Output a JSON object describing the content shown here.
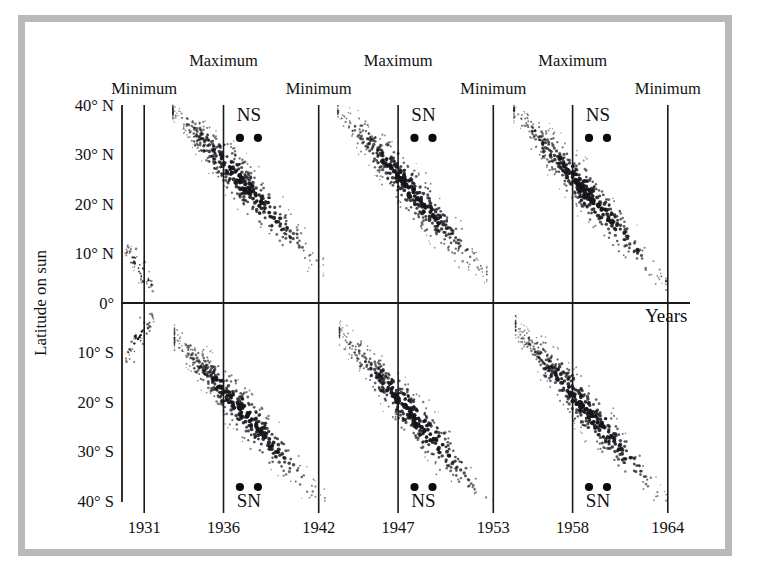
{
  "figure": {
    "kind": "solar-butterfly-diagram",
    "frame_color": "#b9b9b9",
    "background": "#ffffff",
    "ink_color": "#111111"
  },
  "axes": {
    "y_title": "Latitude on sun",
    "x_title": "Years",
    "y_ticks": [
      "40° N",
      "30° N",
      "20° N",
      "10° N",
      "0°",
      "10° S",
      "20° S",
      "30° S",
      "40° S"
    ],
    "x_ticks": [
      "1931",
      "1936",
      "1942",
      "1947",
      "1953",
      "1958",
      "1964"
    ]
  },
  "phase_markers": {
    "minimum_label": "Minimum",
    "maximum_label": "Maximum",
    "minimum_years": [
      "1931",
      "1942",
      "1953",
      "1964"
    ],
    "maximum_years": [
      "1936",
      "1947",
      "1958"
    ]
  },
  "polarity_markers": {
    "north_top": [
      "NS",
      "SN",
      "NS"
    ],
    "south_bottom": [
      "SN",
      "NS",
      "SN"
    ],
    "dot_count_per_marker": 2
  },
  "chart_data": {
    "type": "scatter",
    "xlabel": "Years",
    "ylabel": "Latitude on sun",
    "xlim": [
      1929.6,
      1965.4
    ],
    "ylim": [
      -45,
      45
    ],
    "x_tick_values": [
      1931,
      1936,
      1942,
      1947,
      1953,
      1958,
      1964
    ],
    "x_tick_labels": [
      "1931",
      "1936",
      "1942",
      "1947",
      "1953",
      "1958",
      "1964"
    ],
    "y_tick_values": [
      40,
      30,
      20,
      10,
      0,
      -10,
      -20,
      -30,
      -40
    ],
    "y_tick_labels": [
      "40° N",
      "30° N",
      "20° N",
      "10° N",
      "0°",
      "10° S",
      "20° S",
      "30° S",
      "40° S"
    ],
    "grid": "vertical-lines-at-x-ticks",
    "legend": "none",
    "annotations": [
      {
        "text": "Minimum",
        "x": 1931,
        "position": "above-axis-row1"
      },
      {
        "text": "Maximum",
        "x": 1936,
        "position": "above-axis-row2"
      },
      {
        "text": "Minimum",
        "x": 1942,
        "position": "above-axis-row1"
      },
      {
        "text": "Maximum",
        "x": 1947,
        "position": "above-axis-row2"
      },
      {
        "text": "Minimum",
        "x": 1953,
        "position": "above-axis-row1"
      },
      {
        "text": "Maximum",
        "x": 1958,
        "position": "above-axis-row2"
      },
      {
        "text": "Minimum",
        "x": 1964,
        "position": "above-axis-row1"
      },
      {
        "text": "NS",
        "x": 1937.6,
        "y": 38,
        "position": "north-polarity"
      },
      {
        "text": "SN",
        "x": 1948.6,
        "y": 38,
        "position": "north-polarity"
      },
      {
        "text": "NS",
        "x": 1959.6,
        "y": 38,
        "position": "north-polarity"
      },
      {
        "text": "SN",
        "x": 1937.6,
        "y": -40,
        "position": "south-polarity"
      },
      {
        "text": "NS",
        "x": 1948.6,
        "y": -40,
        "position": "south-polarity"
      },
      {
        "text": "SN",
        "x": 1959.6,
        "y": -40,
        "position": "south-polarity"
      },
      {
        "text": "Years",
        "x": 1964.4,
        "y": -3,
        "position": "x-axis-title"
      }
    ],
    "series": [
      {
        "name": "cycle-1931-tail-north",
        "hemisphere": "north",
        "x_start": 1929.8,
        "x_end": 1931.6,
        "lat_start": 11,
        "lat_end": 3,
        "band_width_deg": 5,
        "density": "sparse",
        "n_points": 55
      },
      {
        "name": "cycle-1931-tail-south",
        "hemisphere": "south",
        "x_start": 1929.8,
        "x_end": 1931.6,
        "lat_start": -11,
        "lat_end": -3,
        "band_width_deg": 5,
        "density": "sparse",
        "n_points": 55
      },
      {
        "name": "cycle-1933-1944-north",
        "hemisphere": "north",
        "x_start": 1932.8,
        "x_end": 1942.3,
        "lat_start": 39,
        "lat_end": 7,
        "band_width_deg": 9,
        "peak_x": 1936.4,
        "density": "dense",
        "n_points": 480
      },
      {
        "name": "cycle-1933-1944-south",
        "hemisphere": "south",
        "x_start": 1932.9,
        "x_end": 1942.4,
        "lat_start": -7,
        "lat_end": -40,
        "band_width_deg": 9,
        "peak_x": 1936.4,
        "density": "dense",
        "n_points": 480
      },
      {
        "name": "cycle-1944-1954-north",
        "hemisphere": "north",
        "x_start": 1943.2,
        "x_end": 1952.6,
        "lat_start": 39,
        "lat_end": 6,
        "band_width_deg": 9,
        "peak_x": 1947.3,
        "density": "dense",
        "n_points": 470
      },
      {
        "name": "cycle-1944-1954-south",
        "hemisphere": "south",
        "x_start": 1943.3,
        "x_end": 1953.0,
        "lat_start": -6,
        "lat_end": -41,
        "band_width_deg": 9,
        "peak_x": 1947.3,
        "density": "dense",
        "n_points": 470
      },
      {
        "name": "cycle-1955-1965-north",
        "hemisphere": "north",
        "x_start": 1954.3,
        "x_end": 1963.9,
        "lat_start": 39,
        "lat_end": 4,
        "band_width_deg": 9,
        "peak_x": 1958.2,
        "density": "dense",
        "n_points": 480
      },
      {
        "name": "cycle-1955-1965-south",
        "hemisphere": "south",
        "x_start": 1954.4,
        "x_end": 1963.9,
        "lat_start": -5,
        "lat_end": -40,
        "band_width_deg": 9,
        "peak_x": 1958.2,
        "density": "dense",
        "n_points": 470
      }
    ]
  }
}
